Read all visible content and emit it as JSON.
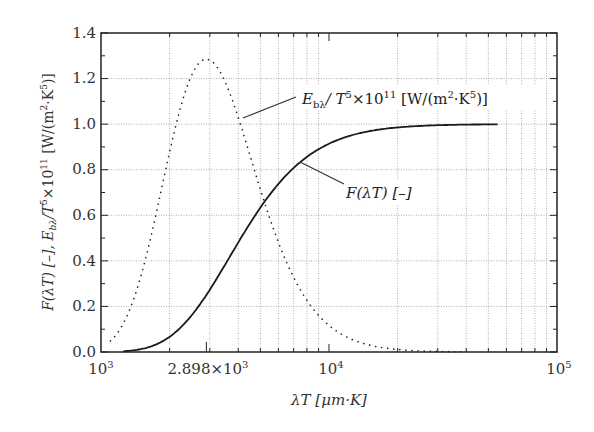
{
  "chart_data": {
    "type": "line",
    "title": "",
    "xlabel": "λT [μm·K]",
    "ylabel": "F(λT) [–],  E_bλ/T^5×10^11 [W/(m^2·K^5)]",
    "xscale": "log",
    "xlim": [
      1000,
      100000
    ],
    "ylim": [
      0,
      1.4
    ],
    "grid": true,
    "x_ticks": [
      {
        "value": 1000,
        "label": "10^3"
      },
      {
        "value": 2898,
        "label": "2.898×10^3"
      },
      {
        "value": 10000,
        "label": "10^4"
      },
      {
        "value": 100000,
        "label": "10^5"
      }
    ],
    "y_ticks": [
      "0.0",
      "0.2",
      "0.4",
      "0.6",
      "0.8",
      "1.0",
      "1.2",
      "1.4"
    ],
    "series": [
      {
        "name": "E_bλ/T^5×10^11 [W/(m^2·K^5)]",
        "style": "dotted",
        "x": [
          1100,
          1300,
          1500,
          1700,
          2000,
          2300,
          2600,
          2898,
          3300,
          3800,
          4500,
          5500,
          7000,
          9000,
          12000,
          16000,
          20000,
          30000,
          40000
        ],
        "values": [
          0.03,
          0.12,
          0.28,
          0.47,
          0.78,
          1.04,
          1.22,
          1.286,
          1.22,
          1.03,
          0.78,
          0.5,
          0.26,
          0.13,
          0.06,
          0.02,
          0.01,
          0.003,
          0.001
        ]
      },
      {
        "name": "F(λT) [–]",
        "style": "solid",
        "x": [
          1200,
          1500,
          2000,
          2500,
          2898,
          3500,
          4000,
          5000,
          6000,
          7000,
          8000,
          10000,
          13000,
          17000,
          25000,
          35000,
          50000
        ],
        "values": [
          0.0,
          0.001,
          0.067,
          0.161,
          0.25,
          0.383,
          0.481,
          0.634,
          0.738,
          0.808,
          0.856,
          0.914,
          0.956,
          0.977,
          0.992,
          0.997,
          1.0
        ]
      }
    ],
    "annotations": [
      {
        "text": "E_bλ/T^5×10^11 [W/(m^2·K^5)]",
        "points_to": "dotted curve"
      },
      {
        "text": "F(λT) [–]",
        "points_to": "solid curve"
      }
    ]
  },
  "labels": {
    "x_axis": "λT [μm·K]",
    "y_axis_a": "F(λT) [–],  E",
    "y_axis_sub": "bλ",
    "y_axis_b": "/T",
    "y_axis_sup5": "5",
    "y_axis_c": "×10",
    "y_axis_sup11": "11",
    "y_axis_d": " [W/(m",
    "y_axis_sup2": "2",
    "y_axis_e": "·K",
    "y_axis_f": ")]",
    "ann_eb_a": "E",
    "ann_eb_sub": "bλ",
    "ann_eb_b": "/ T",
    "ann_eb_sup5": "5",
    "ann_eb_c": "×10",
    "ann_eb_sup11": "11",
    "ann_eb_d": " [W/(m",
    "ann_eb_sup2": "2",
    "ann_eb_e": "·K",
    "ann_eb_f": ")]",
    "ann_f": "F(λT) [–]",
    "xt_1000_base": "10",
    "xt_1000_exp": "3",
    "xt_2898_base": "2.898×10",
    "xt_2898_exp": "3",
    "xt_10000_base": "10",
    "xt_10000_exp": "4",
    "xt_100000_base": "10",
    "xt_100000_exp": "5",
    "y0": "0.0",
    "y1": "0.2",
    "y2": "0.4",
    "y3": "0.6",
    "y4": "0.8",
    "y5": "1.0",
    "y6": "1.2",
    "y7": "1.4"
  }
}
